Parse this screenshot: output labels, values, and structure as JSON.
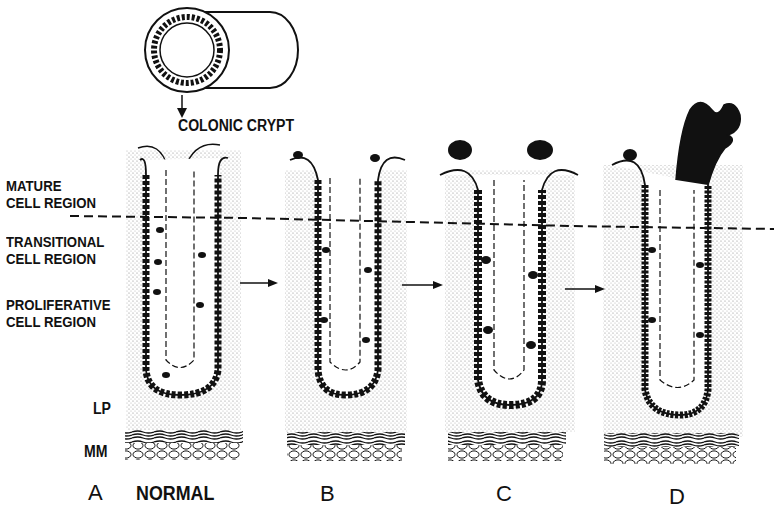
{
  "figure": {
    "top_callout": "COLONIC CRYPT",
    "region_labels": [
      {
        "line1": "MATURE",
        "line2": "CELL REGION"
      },
      {
        "line1": "TRANSITIONAL",
        "line2": "CELL REGION"
      },
      {
        "line1": "PROLIFERATIVE",
        "line2": "CELL REGION"
      }
    ],
    "layer_labels": {
      "lp": "LP",
      "mm": "MM"
    },
    "panels": [
      {
        "letter": "A",
        "caption": "NORMAL"
      },
      {
        "letter": "B",
        "caption": ""
      },
      {
        "letter": "C",
        "caption": ""
      },
      {
        "letter": "D",
        "caption": ""
      }
    ],
    "colors": {
      "ink": "#111111",
      "stipple": "#cfcfcf",
      "background": "#ffffff"
    }
  }
}
